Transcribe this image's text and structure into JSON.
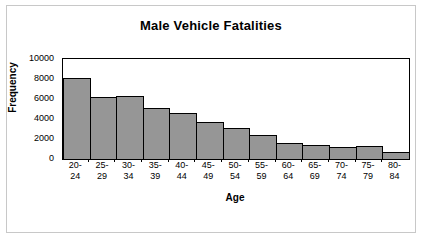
{
  "chart_data": {
    "type": "bar",
    "title": "Male Vehicle Fatalities",
    "xlabel": "Age",
    "ylabel": "Frequency",
    "categories": [
      "20-24",
      "25-29",
      "30-34",
      "35-39",
      "40-44",
      "45-49",
      "50-54",
      "55-59",
      "60-64",
      "65-69",
      "70-74",
      "75-79",
      "80-84"
    ],
    "category_lines": [
      [
        "20-",
        "24"
      ],
      [
        "25-",
        "29"
      ],
      [
        "30-",
        "34"
      ],
      [
        "35-",
        "39"
      ],
      [
        "40-",
        "44"
      ],
      [
        "45-",
        "49"
      ],
      [
        "50-",
        "54"
      ],
      [
        "55-",
        "59"
      ],
      [
        "60-",
        "64"
      ],
      [
        "65-",
        "69"
      ],
      [
        "70-",
        "74"
      ],
      [
        "75-",
        "79"
      ],
      [
        "80-",
        "84"
      ]
    ],
    "values": [
      8100,
      6200,
      6300,
      5150,
      4650,
      3750,
      3100,
      2400,
      1600,
      1400,
      1250,
      1300,
      700
    ],
    "ylim": [
      0,
      10000
    ],
    "ytick_values": [
      10000,
      8000,
      6000,
      4000,
      2000,
      0
    ],
    "ytick_labels": [
      "10000",
      "8000",
      "6000",
      "4000",
      "2000",
      "0"
    ],
    "grid": false,
    "legend": false,
    "bar_color": "#969696",
    "bar_edge_color": "#000000",
    "plot_frame_color": "#000000",
    "page_border_color": "#c8c8c8",
    "background_color": "#ffffff"
  }
}
